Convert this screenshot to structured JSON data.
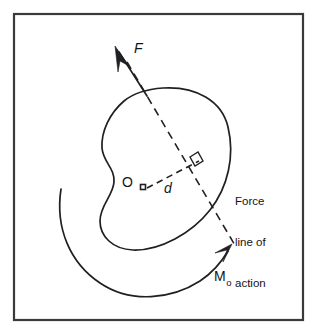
{
  "figure": {
    "kind": "mechanics-diagram",
    "background_color": "#ffffff",
    "ink_color": "#202024",
    "frame_color": "#3a3a3e"
  },
  "labels": {
    "force": "F",
    "origin": "O",
    "distance": "d",
    "moment_symbol": "M",
    "moment_subscript": "o",
    "force_line_line1": "Force",
    "force_line_line2": "line of",
    "force_line_line3": "action"
  },
  "geometry": {
    "frame": {
      "x": 13,
      "y": 13,
      "width": 290,
      "height": 307
    },
    "pivot_point": {
      "x": 143,
      "y": 187
    },
    "force_arrow_tip": {
      "x": 117,
      "y": 49
    },
    "perpendicular_foot": {
      "x": 200,
      "y": 163
    },
    "action_line_start": {
      "x": 127,
      "y": 62
    },
    "action_line_end": {
      "x": 236,
      "y": 247
    },
    "moment_arrow_tip": {
      "x": 231,
      "y": 246
    }
  }
}
